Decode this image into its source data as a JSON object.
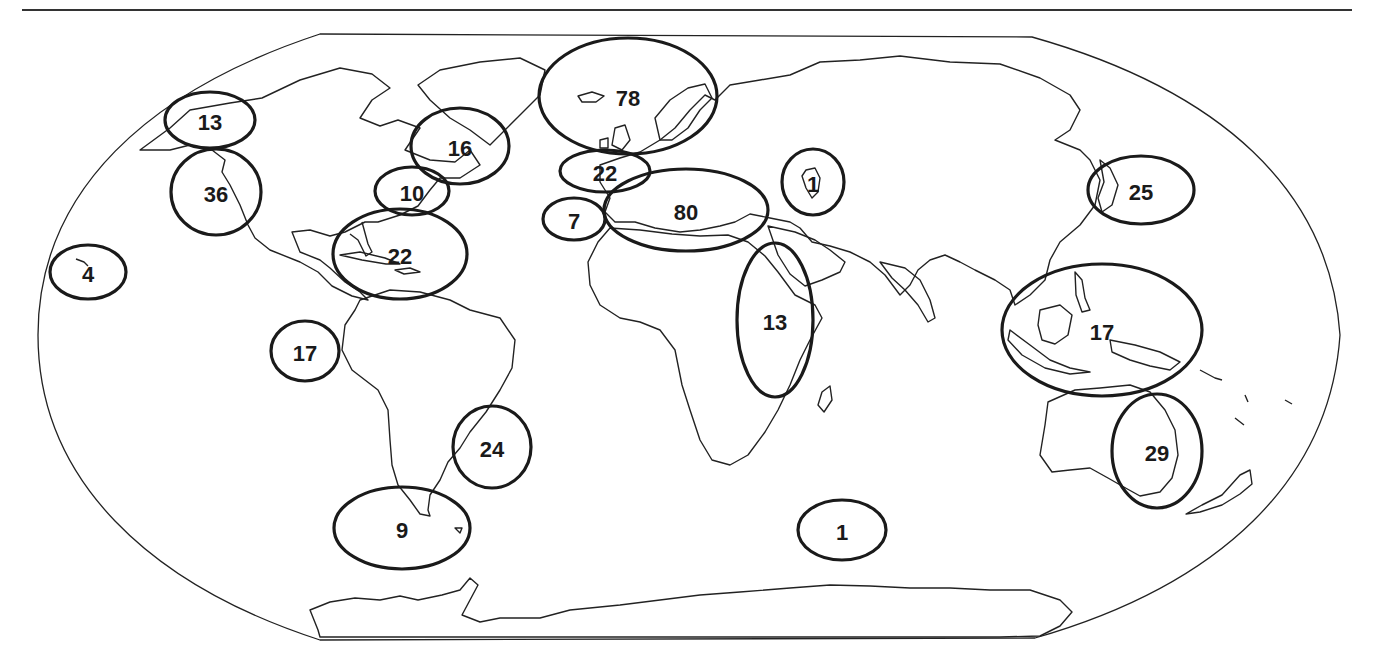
{
  "map": {
    "projection": "world outline, pseudo-cylindrical",
    "ring_color": "#1a1a1a",
    "regions": [
      {
        "id": "alaska",
        "label": "13",
        "cx": 210,
        "cy": 120,
        "rx": 45,
        "ry": 28
      },
      {
        "id": "us-west-coast",
        "label": "36",
        "cx": 216,
        "cy": 192,
        "rx": 45,
        "ry": 43
      },
      {
        "id": "hawaii",
        "label": "4",
        "cx": 88,
        "cy": 272,
        "rx": 38,
        "ry": 27
      },
      {
        "id": "canada-east",
        "label": "16",
        "cx": 460,
        "cy": 146,
        "rx": 49,
        "ry": 38
      },
      {
        "id": "us-northeast",
        "label": "10",
        "cx": 412,
        "cy": 191,
        "rx": 37,
        "ry": 24
      },
      {
        "id": "caribbean",
        "label": "22",
        "cx": 400,
        "cy": 254,
        "rx": 67,
        "ry": 45
      },
      {
        "id": "galapagos",
        "label": "17",
        "cx": 305,
        "cy": 351,
        "rx": 34,
        "ry": 30
      },
      {
        "id": "south-brazil",
        "label": "24",
        "cx": 492,
        "cy": 447,
        "rx": 39,
        "ry": 41
      },
      {
        "id": "patagonia",
        "label": "9",
        "cx": 402,
        "cy": 528,
        "rx": 68,
        "ry": 41
      },
      {
        "id": "north-europe",
        "label": "78",
        "cx": 628,
        "cy": 96,
        "rx": 89,
        "ry": 58
      },
      {
        "id": "west-europe",
        "label": "22",
        "cx": 605,
        "cy": 171,
        "rx": 45,
        "ry": 21
      },
      {
        "id": "canary-islands",
        "label": "7",
        "cx": 574,
        "cy": 219,
        "rx": 31,
        "ry": 21
      },
      {
        "id": "mediterranean",
        "label": "80",
        "cx": 686,
        "cy": 210,
        "rx": 82,
        "ry": 41
      },
      {
        "id": "caspian",
        "label": "1",
        "cx": 813,
        "cy": 182,
        "rx": 31,
        "ry": 33
      },
      {
        "id": "east-africa-arabia",
        "label": "13",
        "cx": 775,
        "cy": 320,
        "rx": 38,
        "ry": 77
      },
      {
        "id": "southern-ocean",
        "label": "1",
        "cx": 842,
        "cy": 530,
        "rx": 44,
        "ry": 30
      },
      {
        "id": "japan-korea",
        "label": "25",
        "cx": 1141,
        "cy": 190,
        "rx": 53,
        "ry": 34
      },
      {
        "id": "southeast-asia",
        "label": "17",
        "cx": 1102,
        "cy": 330,
        "rx": 100,
        "ry": 66
      },
      {
        "id": "east-australia",
        "label": "29",
        "cx": 1157,
        "cy": 451,
        "rx": 45,
        "ry": 57
      }
    ]
  }
}
